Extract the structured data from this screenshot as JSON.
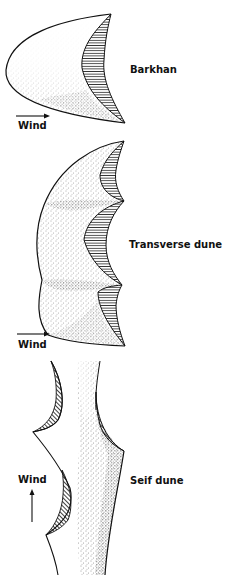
{
  "diagram": {
    "colors": {
      "ink": "#111111",
      "background": "#ffffff",
      "stipple": "#333333"
    },
    "dunes": [
      {
        "id": "barkhan",
        "label": "Barkhan",
        "wind_label": "Wind",
        "wind_direction": "right"
      },
      {
        "id": "transverse",
        "label": "Transverse dune",
        "wind_label": "Wind",
        "wind_direction": "right"
      },
      {
        "id": "seif",
        "label": "Seif dune",
        "wind_label": "Wind",
        "wind_direction": "up"
      }
    ]
  }
}
